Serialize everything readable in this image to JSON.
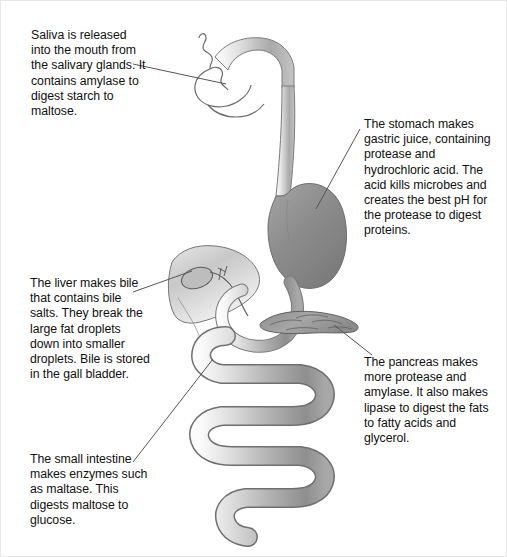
{
  "diagram": {
    "colors": {
      "background": "#ffffff",
      "text": "#111111",
      "leader_line": "#555555",
      "organ_outline": "#5a5a5a",
      "tract_light": "#f2f2f2",
      "tract_mid": "#b9b9b9",
      "tract_dark": "#8f8f8f",
      "stomach_fill": "#8a8a8a",
      "liver_fill": "#cfcfcf",
      "pancreas_fill": "#9a9a9a"
    },
    "callouts": [
      {
        "id": "saliva",
        "organ": "salivary-glands",
        "text": "Saliva is released into the mouth from the salivary glands. It contains amylase to digest starch to maltose."
      },
      {
        "id": "stomach",
        "organ": "stomach",
        "text": "The stomach makes gastric juice, containing protease and hydrochloric acid. The acid kills microbes and creates the best pH for the protease to digest proteins."
      },
      {
        "id": "liver",
        "organ": "liver",
        "text": "The liver makes bile that contains bile salts. They break the large fat droplets down into smaller droplets. Bile is stored in the gall bladder."
      },
      {
        "id": "pancreas",
        "organ": "pancreas",
        "text": "The pancreas makes more protease and amylase. It also makes lipase to digest the fats to fatty acids and glycerol."
      },
      {
        "id": "intestine",
        "organ": "small-intestine",
        "text": "The small intestine makes enzymes such as maltase. This digests maltose to glucose."
      }
    ]
  }
}
